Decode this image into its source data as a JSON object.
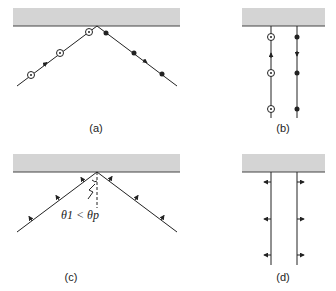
{
  "figure": {
    "panels": [
      {
        "id": "a",
        "label": "(a)",
        "description": "Reflection of s-polarized (circled dots) incident and p-polarized (filled dots) reflected ray at oblique incidence"
      },
      {
        "id": "b",
        "label": "(b)",
        "description": "Normal incidence: circled dots on upward ray, filled dots on downward ray"
      },
      {
        "id": "c",
        "label": "(c)",
        "description": "Oblique incidence with in-plane polarization arrows",
        "annotation": "θ1 < θp"
      },
      {
        "id": "d",
        "label": "(d)",
        "description": "Normal incidence with in-plane polarization arrows"
      }
    ],
    "colors": {
      "slab": "#d4d4d4",
      "line": "#222222"
    }
  }
}
